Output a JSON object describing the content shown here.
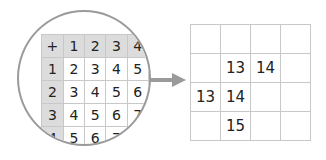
{
  "magnifier": {
    "table": {
      "rows": [
        [
          "+",
          "1",
          "2",
          "3",
          "4"
        ],
        [
          "1",
          "2",
          "3",
          "4",
          "5"
        ],
        [
          "2",
          "3",
          "4",
          "5",
          "6"
        ],
        [
          "3",
          "4",
          "5",
          "6",
          "7"
        ],
        [
          "4",
          "5",
          "6",
          "7",
          ""
        ]
      ]
    }
  },
  "arrow": {
    "direction": "right",
    "color": "#9a9a9a"
  },
  "result_grid": {
    "rows": [
      [
        "",
        "",
        "",
        ""
      ],
      [
        "",
        "13",
        "14",
        ""
      ],
      [
        "13",
        "14",
        "",
        ""
      ],
      [
        "",
        "15",
        "",
        ""
      ]
    ]
  }
}
